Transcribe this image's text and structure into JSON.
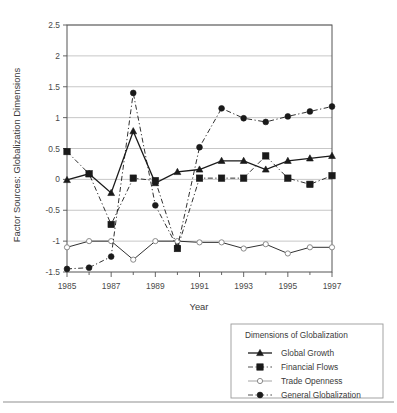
{
  "chart_data": {
    "type": "line",
    "title": "",
    "xlabel": "Year",
    "ylabel": "Factor Sources: Globalization Dimensions",
    "xlim": [
      1985,
      1997
    ],
    "ylim": [
      -1.5,
      2.5
    ],
    "grid": true,
    "legend_position": "bottom-right",
    "legend_title": "Dimensions of Globalization",
    "x_tick_labels": [
      "1985",
      "1987",
      "1989",
      "1991",
      "1993",
      "1995",
      "1997"
    ],
    "x_ticks": [
      1985,
      1987,
      1989,
      1991,
      1993,
      1995,
      1997
    ],
    "y_tick_labels": [
      "2.5",
      "2",
      "1.5",
      "1",
      "0.5",
      "0",
      "-0.5",
      "-1",
      "-1.5"
    ],
    "y_ticks": [
      2.5,
      2,
      1.5,
      1,
      0.5,
      0,
      -0.5,
      -1,
      -1.5
    ],
    "x": [
      1985,
      1986,
      1987,
      1988,
      1989,
      1990,
      1991,
      1992,
      1993,
      1994,
      1995,
      1996,
      1997
    ],
    "series": [
      {
        "name": "Global Growth",
        "marker": "triangle",
        "dash": "solid",
        "values": [
          -0.01,
          0.09,
          -0.22,
          0.78,
          -0.06,
          0.12,
          0.16,
          0.3,
          0.3,
          0.16,
          0.3,
          0.34,
          0.38
        ]
      },
      {
        "name": "Financial Flows",
        "marker": "square",
        "dash": "dashdot",
        "values": [
          0.45,
          0.09,
          -0.73,
          0.02,
          -0.02,
          -1.12,
          0.02,
          0.02,
          0.02,
          0.38,
          0.02,
          -0.08,
          0.06
        ]
      },
      {
        "name": "Trade Openness",
        "marker": "circle-open",
        "dash": "solid-light",
        "values": [
          -1.1,
          -1.0,
          -1.0,
          -1.3,
          -1.0,
          -1.0,
          -1.02,
          -1.02,
          -1.12,
          -1.05,
          -1.2,
          -1.1,
          -1.1
        ]
      },
      {
        "name": "General Globalization",
        "marker": "circle-filled",
        "dash": "dashdot",
        "values": [
          -1.45,
          -1.43,
          -1.25,
          1.4,
          -0.42,
          -1.1,
          0.52,
          1.15,
          0.99,
          0.93,
          1.02,
          1.1,
          1.18
        ]
      }
    ]
  },
  "legend": {
    "title": "Dimensions of Globalization",
    "entries": [
      {
        "label": "Global Growth"
      },
      {
        "label": "Financial Flows"
      },
      {
        "label": "Trade Openness"
      },
      {
        "label": "General Globalization"
      }
    ]
  },
  "colors": {
    "ink": "#1a1a1a",
    "grid": "#b9b9b9",
    "axis": "#555555",
    "text": "#3a3a3a",
    "background": "#ffffff"
  }
}
